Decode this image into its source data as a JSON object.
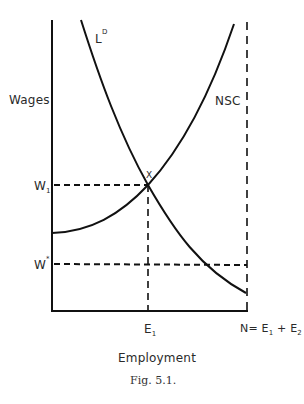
{
  "figure": {
    "caption": "Fig. 5.1.",
    "y_axis_label": "Wages",
    "x_axis_label": "Employment",
    "curves": [
      {
        "id": "labor-demand",
        "label": "L",
        "label_sup": "D",
        "description": "Labor demand curve, downward sloping"
      },
      {
        "id": "nsc",
        "label": "NSC",
        "description": "Upward sloping supply curve starting at vertical axis"
      }
    ],
    "points": [
      {
        "label": "X",
        "description": "Intersection of L^D and NSC at (E1, W1)"
      }
    ],
    "y_ticks": [
      {
        "label": "W",
        "sub": "1"
      },
      {
        "label": "W",
        "sup": "*"
      }
    ],
    "x_ticks": [
      {
        "label": "E",
        "sub": "1"
      },
      {
        "label": "N= E",
        "sub": "1",
        "mid": " + E",
        "sub2": "2"
      }
    ],
    "colors": {
      "line": "#111111",
      "text": "#2a2a2a",
      "background": "#ffffff"
    }
  }
}
